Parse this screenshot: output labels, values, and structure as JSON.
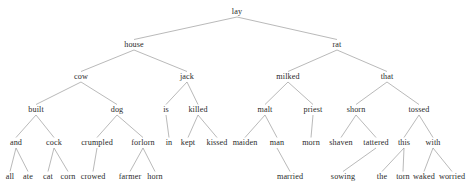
{
  "figure": {
    "type": "parse-tree",
    "background_color": "#ffffff",
    "edge_color": "#8a8a8a",
    "text_color": "#2b2b2b",
    "width": 475,
    "height": 192
  },
  "chart_data": {
    "type": "tree",
    "title": "",
    "root": "lay",
    "levels": [
      [
        "lay"
      ],
      [
        "house",
        "rat"
      ],
      [
        "cow",
        "jack",
        "milked",
        "that"
      ],
      [
        "built",
        "dog",
        "is",
        "killed",
        "malt",
        "priest",
        "shorn",
        "tossed"
      ],
      [
        "and",
        "cock",
        "crumpled",
        "forlorn",
        "in",
        "kept",
        "kissed",
        "maiden",
        "man",
        "morn",
        "shaven",
        "tattered",
        "this",
        "with"
      ],
      [
        "all",
        "ate",
        "cat",
        "corn",
        "crowed",
        "farmer",
        "horn",
        "married",
        "sowing",
        "the",
        "torn",
        "waked",
        "worried"
      ]
    ],
    "nodes": [
      {
        "id": "lay",
        "label": "lay",
        "x": 237,
        "y": 12,
        "level": 0
      },
      {
        "id": "house",
        "label": "house",
        "x": 134,
        "y": 45,
        "level": 1
      },
      {
        "id": "rat",
        "label": "rat",
        "x": 337,
        "y": 45,
        "level": 1
      },
      {
        "id": "cow",
        "label": "cow",
        "x": 81,
        "y": 77,
        "level": 2
      },
      {
        "id": "jack",
        "label": "jack",
        "x": 187,
        "y": 77,
        "level": 2
      },
      {
        "id": "milked",
        "label": "milked",
        "x": 288,
        "y": 77,
        "level": 2
      },
      {
        "id": "that",
        "label": "that",
        "x": 387,
        "y": 77,
        "level": 2
      },
      {
        "id": "built",
        "label": "built",
        "x": 36,
        "y": 110,
        "level": 3
      },
      {
        "id": "dog",
        "label": "dog",
        "x": 117,
        "y": 110,
        "level": 3
      },
      {
        "id": "is",
        "label": "is",
        "x": 166,
        "y": 110,
        "level": 3
      },
      {
        "id": "killed",
        "label": "killed",
        "x": 198,
        "y": 110,
        "level": 3
      },
      {
        "id": "malt",
        "label": "malt",
        "x": 265,
        "y": 110,
        "level": 3
      },
      {
        "id": "priest",
        "label": "priest",
        "x": 313,
        "y": 110,
        "level": 3
      },
      {
        "id": "shorn",
        "label": "shorn",
        "x": 356,
        "y": 110,
        "level": 3
      },
      {
        "id": "tossed",
        "label": "tossed",
        "x": 419,
        "y": 110,
        "level": 3
      },
      {
        "id": "and",
        "label": "and",
        "x": 16,
        "y": 143,
        "level": 4
      },
      {
        "id": "cock",
        "label": "cock",
        "x": 54,
        "y": 143,
        "level": 4
      },
      {
        "id": "crumpled",
        "label": "crumpled",
        "x": 97,
        "y": 143,
        "level": 4
      },
      {
        "id": "forlorn",
        "label": "forlorn",
        "x": 143,
        "y": 143,
        "level": 4
      },
      {
        "id": "in",
        "label": "in",
        "x": 169,
        "y": 143,
        "level": 4
      },
      {
        "id": "kept",
        "label": "kept",
        "x": 188,
        "y": 143,
        "level": 4
      },
      {
        "id": "kissed",
        "label": "kissed",
        "x": 217,
        "y": 143,
        "level": 4
      },
      {
        "id": "maiden",
        "label": "maiden",
        "x": 245,
        "y": 143,
        "level": 4
      },
      {
        "id": "man",
        "label": "man",
        "x": 277,
        "y": 143,
        "level": 4
      },
      {
        "id": "morn",
        "label": "morn",
        "x": 311,
        "y": 143,
        "level": 4
      },
      {
        "id": "shaven",
        "label": "shaven",
        "x": 341,
        "y": 143,
        "level": 4
      },
      {
        "id": "tattered",
        "label": "tattered",
        "x": 376,
        "y": 143,
        "level": 4
      },
      {
        "id": "this",
        "label": "this",
        "x": 404,
        "y": 143,
        "level": 4
      },
      {
        "id": "with",
        "label": "with",
        "x": 433,
        "y": 143,
        "level": 4
      },
      {
        "id": "all",
        "label": "all",
        "x": 10,
        "y": 177,
        "level": 5
      },
      {
        "id": "ate",
        "label": "ate",
        "x": 28,
        "y": 177,
        "level": 5
      },
      {
        "id": "cat",
        "label": "cat",
        "x": 48,
        "y": 177,
        "level": 5
      },
      {
        "id": "corn",
        "label": "corn",
        "x": 68,
        "y": 177,
        "level": 5
      },
      {
        "id": "crowed",
        "label": "crowed",
        "x": 93,
        "y": 177,
        "level": 5
      },
      {
        "id": "farmer",
        "label": "farmer",
        "x": 130,
        "y": 177,
        "level": 5
      },
      {
        "id": "horn",
        "label": "horn",
        "x": 155,
        "y": 177,
        "level": 5
      },
      {
        "id": "married",
        "label": "married",
        "x": 290,
        "y": 177,
        "level": 5
      },
      {
        "id": "sowing",
        "label": "sowing",
        "x": 343,
        "y": 177,
        "level": 5
      },
      {
        "id": "the",
        "label": "the",
        "x": 382,
        "y": 177,
        "level": 5
      },
      {
        "id": "torn",
        "label": "torn",
        "x": 403,
        "y": 177,
        "level": 5
      },
      {
        "id": "waked",
        "label": "waked",
        "x": 424,
        "y": 177,
        "level": 5
      },
      {
        "id": "worried",
        "label": "worried",
        "x": 452,
        "y": 177,
        "level": 5
      }
    ],
    "edges": [
      [
        "lay",
        "house"
      ],
      [
        "lay",
        "rat"
      ],
      [
        "house",
        "cow"
      ],
      [
        "house",
        "jack"
      ],
      [
        "rat",
        "milked"
      ],
      [
        "rat",
        "that"
      ],
      [
        "cow",
        "built"
      ],
      [
        "cow",
        "dog"
      ],
      [
        "jack",
        "is"
      ],
      [
        "jack",
        "killed"
      ],
      [
        "milked",
        "malt"
      ],
      [
        "milked",
        "priest"
      ],
      [
        "that",
        "shorn"
      ],
      [
        "that",
        "tossed"
      ],
      [
        "built",
        "and"
      ],
      [
        "built",
        "cock"
      ],
      [
        "dog",
        "crumpled"
      ],
      [
        "dog",
        "forlorn"
      ],
      [
        "is",
        "in"
      ],
      [
        "killed",
        "kept"
      ],
      [
        "killed",
        "kissed"
      ],
      [
        "malt",
        "maiden"
      ],
      [
        "malt",
        "man"
      ],
      [
        "priest",
        "morn"
      ],
      [
        "shorn",
        "shaven"
      ],
      [
        "shorn",
        "tattered"
      ],
      [
        "tossed",
        "this"
      ],
      [
        "tossed",
        "with"
      ],
      [
        "and",
        "all"
      ],
      [
        "and",
        "ate"
      ],
      [
        "cock",
        "cat"
      ],
      [
        "cock",
        "corn"
      ],
      [
        "crumpled",
        "crowed"
      ],
      [
        "forlorn",
        "farmer"
      ],
      [
        "forlorn",
        "horn"
      ],
      [
        "man",
        "married"
      ],
      [
        "tattered",
        "sowing"
      ],
      [
        "this",
        "the"
      ],
      [
        "this",
        "torn"
      ],
      [
        "with",
        "waked"
      ],
      [
        "with",
        "worried"
      ]
    ]
  }
}
